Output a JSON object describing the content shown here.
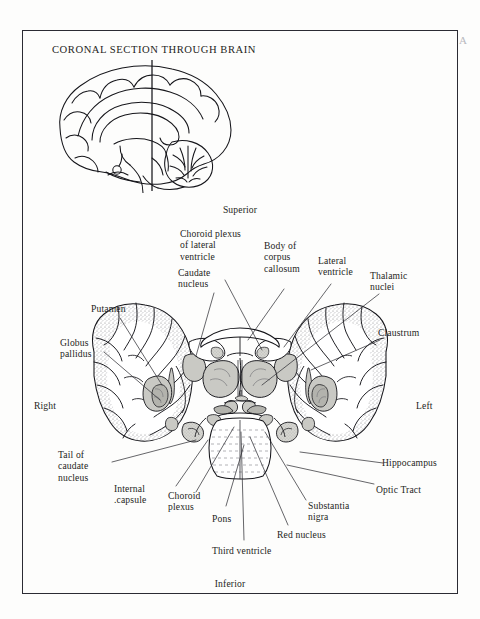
{
  "page": {
    "corner_mark": "A",
    "frame_color": "#2b2b33",
    "background_color": "#fdfdfc",
    "ink_color": "#1d1d22",
    "stipple_color": "#6d6d72",
    "nucleus_fill": "#c9c9c4"
  },
  "inset": {
    "title": "CORONAL SECTION THROUGH BRAIN",
    "description": "mid-sagittal brain with vertical section plane line"
  },
  "orientation": {
    "superior": "Superior",
    "inferior": "Inferior",
    "left": "Left",
    "right": "Right"
  },
  "labels": [
    {
      "id": "choroid-plexus-lateral-ventricle",
      "text": "Choroid plexus\nof lateral\nventricle"
    },
    {
      "id": "caudate-nucleus",
      "text": "Caudate\nnucleus"
    },
    {
      "id": "body-of-corpus-callosum",
      "text": "Body of\ncorpus\ncallosum"
    },
    {
      "id": "lateral-ventricle",
      "text": "Lateral\nventricle"
    },
    {
      "id": "thalamic-nuclei",
      "text": "Thalamic\nnuclei"
    },
    {
      "id": "putamen",
      "text": "Putamen"
    },
    {
      "id": "globus-pallidus",
      "text": "Globus\npallidus"
    },
    {
      "id": "claustrum",
      "text": "Claustrum"
    },
    {
      "id": "hippocampus",
      "text": "Hippocampus"
    },
    {
      "id": "optic-tract",
      "text": "Optic Tract"
    },
    {
      "id": "tail-of-caudate-nucleus",
      "text": "Tail of\ncaudate\nnucleus"
    },
    {
      "id": "internal-capsule",
      "text": "Internal\n.capsule"
    },
    {
      "id": "choroid-plexus",
      "text": "Choroid\nplexus"
    },
    {
      "id": "pons",
      "text": "Pons"
    },
    {
      "id": "third-ventricle",
      "text": "Third ventricle"
    },
    {
      "id": "red-nucleus",
      "text": "Red nucleus"
    },
    {
      "id": "substantia-nigra",
      "text": "Substantia\nnigra"
    }
  ]
}
